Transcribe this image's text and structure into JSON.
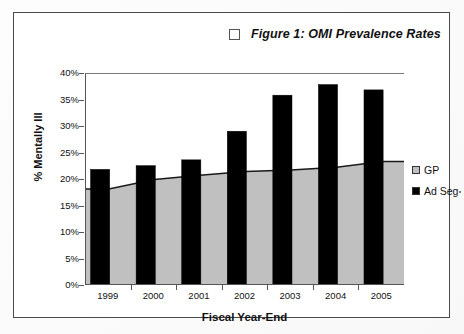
{
  "figure": {
    "title": "Figure 1: OMI Prevalence Rates",
    "title_marker_icon": "empty-square-marker",
    "frame_color": "#4a4a4a"
  },
  "legend": {
    "position": "right",
    "items": [
      {
        "label": "GP",
        "color": "#c0c0c0",
        "swatch_icon": "gray-square-swatch"
      },
      {
        "label": "Ad Seg",
        "color": "#000000",
        "swatch_icon": "black-square-swatch"
      }
    ]
  },
  "axes": {
    "y_title": "% Mentally Ill",
    "x_title": "Fiscal Year-End",
    "y_ticks": [
      "0%",
      "5%",
      "10%",
      "15%",
      "20%",
      "25%",
      "30%",
      "35%",
      "40%"
    ],
    "x_ticks": [
      "1999",
      "2000",
      "2001",
      "2002",
      "2003",
      "2004",
      "2005"
    ]
  },
  "chart_data": {
    "type": "bar",
    "title": "Figure 1: OMI Prevalence Rates",
    "xlabel": "Fiscal Year-End",
    "ylabel": "% Mentally Ill",
    "categories": [
      "1999",
      "2000",
      "2001",
      "2002",
      "2003",
      "2004",
      "2005"
    ],
    "series": [
      {
        "name": "GP",
        "type": "area",
        "color": "#c0c0c0",
        "values": [
          18.3,
          20.1,
          20.9,
          21.6,
          21.9,
          22.4,
          23.5
        ]
      },
      {
        "name": "Ad Seg",
        "type": "bar",
        "color": "#000000",
        "values": [
          22.0,
          22.7,
          23.8,
          29.2,
          36.0,
          38.0,
          37.0
        ]
      }
    ],
    "ylim": [
      0,
      40
    ],
    "ytick_step": 5,
    "ytick_format": "percent",
    "grid": false,
    "legend_position": "right"
  }
}
